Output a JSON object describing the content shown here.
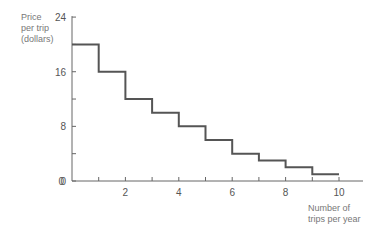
{
  "chart_data": {
    "type": "line",
    "subtype": "step",
    "title": "",
    "ylabel": "Price per trip (dollars)",
    "ylabel_lines": [
      "Price",
      "per trip",
      "(dollars)"
    ],
    "xlabel": "Number of trips per year",
    "xlabel_lines": [
      "Number of",
      "trips per year"
    ],
    "xlim": [
      0,
      10
    ],
    "ylim": [
      0,
      24
    ],
    "x_ticks": [
      1,
      2,
      3,
      4,
      5,
      6,
      7,
      8,
      9,
      10
    ],
    "x_tick_labels": [
      "2",
      "4",
      "6",
      "8",
      "10"
    ],
    "x_tick_label_values": [
      2,
      4,
      6,
      8,
      10
    ],
    "y_ticks": [
      0,
      4,
      8,
      12,
      16,
      20,
      24
    ],
    "y_tick_labels": [
      "0",
      "8",
      "16",
      "24"
    ],
    "y_tick_label_values": [
      0,
      8,
      16,
      24
    ],
    "grid": false,
    "legend": null,
    "series": [
      {
        "name": "Demand (price per trip)",
        "steps": [
          {
            "x_start": 0,
            "x_end": 1,
            "y": 20
          },
          {
            "x_start": 1,
            "x_end": 2,
            "y": 16
          },
          {
            "x_start": 2,
            "x_end": 3,
            "y": 12
          },
          {
            "x_start": 3,
            "x_end": 4,
            "y": 10
          },
          {
            "x_start": 4,
            "x_end": 5,
            "y": 8
          },
          {
            "x_start": 5,
            "x_end": 6,
            "y": 6
          },
          {
            "x_start": 6,
            "x_end": 7,
            "y": 4
          },
          {
            "x_start": 7,
            "x_end": 8,
            "y": 3
          },
          {
            "x_start": 8,
            "x_end": 9,
            "y": 2
          },
          {
            "x_start": 9,
            "x_end": 10,
            "y": 1
          }
        ]
      }
    ],
    "colors": {
      "line": "#555555",
      "axis": "#666666",
      "text": "#777777"
    }
  }
}
